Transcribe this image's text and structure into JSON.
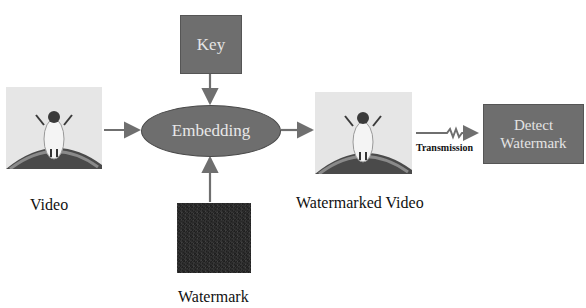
{
  "diagram": {
    "nodes": {
      "video": {
        "label": "Video",
        "icon": "video-frame-icon"
      },
      "key": {
        "label": "Key"
      },
      "embedding": {
        "label": "Embedding"
      },
      "watermark": {
        "label": "Watermark",
        "icon": "noise-pattern-icon"
      },
      "watermarked_video": {
        "label": "Watermarked Video",
        "icon": "video-frame-icon"
      },
      "detect": {
        "line1": "Detect",
        "line2": "Watermark"
      }
    },
    "edges": [
      {
        "from": "video",
        "to": "embedding"
      },
      {
        "from": "key",
        "to": "embedding"
      },
      {
        "from": "watermark",
        "to": "embedding"
      },
      {
        "from": "embedding",
        "to": "watermarked_video"
      },
      {
        "from": "watermarked_video",
        "to": "detect",
        "label": "Transmission"
      }
    ],
    "transmission_label": "Transmission",
    "colors": {
      "box": "#6e6e6e",
      "arrow": "#6f6f6f",
      "watermark": "#2b2b2b",
      "text_light": "#e4e4e4"
    }
  }
}
